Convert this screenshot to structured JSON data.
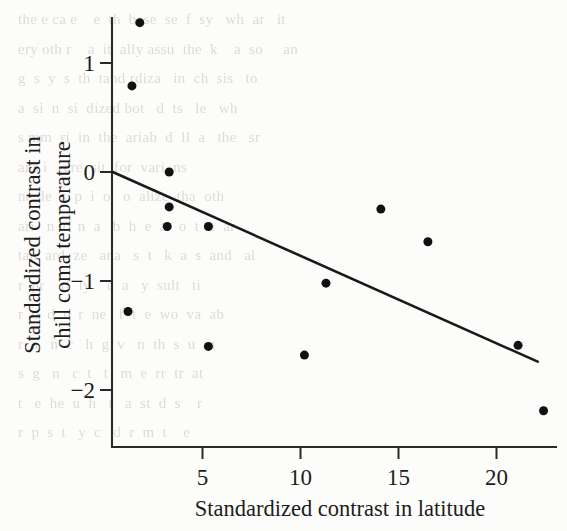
{
  "page": {
    "background_color": "#fcfcfa",
    "ink_color": "#1d1d1d",
    "bleed_through_lines": [
      "the e ca e    e  th  base  se  f  sy   wh  ar   it",
      "ery oth r    a  it  ally assu  the  k    a  so     an",
      "g  s  y  s  th  tand rdiza   in  ch  sis   to",
      "a  si  n  si  dized bot   d  ts   le   wh",
      "s mm  ri  in  the  ariab  d  ll  a   the   sr",
      "ans i    ere  sit  for  vari  ns",
      "ne  le  s  p  i  o   o  alize  tha  oth",
      "ari   n  c  n  a   b  h  e  a   o  t  n  ar",
      "tan  ard  ze   ana   s  t   k  a  s  and   al",
      "r  pr    rl  ly    e  a   y  sult   ti",
      "r  o  d  e  r  ne   f  t  e  wo  va  ab",
      "r  a   n  c   h  g  v   n  th  s  u   n",
      "s  g   n   c  t   t   m  e  rr  tr  at",
      "t   e  he  u  h   t   a  st  d  s    r",
      "r  p  s  t   y  c   d  r  m  t    e"
    ]
  },
  "chart_data": {
    "type": "scatter",
    "title": "",
    "xlabel": "Standardized contrast in latitude",
    "ylabel": "Standardized contrast in chill coma temperature",
    "ylabel_lines": [
      "Standardized contrast in",
      "chill coma temperature"
    ],
    "xlim": [
      0.4,
      23.2
    ],
    "ylim": [
      -2.55,
      1.62
    ],
    "xticks": [
      5,
      10,
      15,
      20
    ],
    "xtick_labels": [
      "5",
      "10",
      "15",
      "20"
    ],
    "yticks": [
      1,
      0,
      -1,
      -2
    ],
    "ytick_labels": [
      "1",
      "0",
      "−1",
      "−2"
    ],
    "grid": false,
    "legend": "none",
    "marker": {
      "shape": "circle",
      "color": "#111111",
      "size_px": 9
    },
    "points": [
      {
        "x": 1.8,
        "y": 1.37
      },
      {
        "x": 1.4,
        "y": 0.79
      },
      {
        "x": 3.3,
        "y": 0.0
      },
      {
        "x": 3.3,
        "y": -0.32
      },
      {
        "x": 3.2,
        "y": -0.5
      },
      {
        "x": 5.3,
        "y": -0.5
      },
      {
        "x": 1.2,
        "y": -1.28
      },
      {
        "x": 5.3,
        "y": -1.6
      },
      {
        "x": 10.2,
        "y": -1.68
      },
      {
        "x": 11.3,
        "y": -1.02
      },
      {
        "x": 14.1,
        "y": -0.34
      },
      {
        "x": 16.5,
        "y": -0.64
      },
      {
        "x": 21.1,
        "y": -1.59
      },
      {
        "x": 22.4,
        "y": -2.19
      }
    ],
    "series": [
      {
        "name": "regression line",
        "type": "line",
        "color": "#1a1a1a",
        "x": [
          0.42,
          22.1
        ],
        "y": [
          0.0,
          -1.74
        ]
      }
    ]
  }
}
